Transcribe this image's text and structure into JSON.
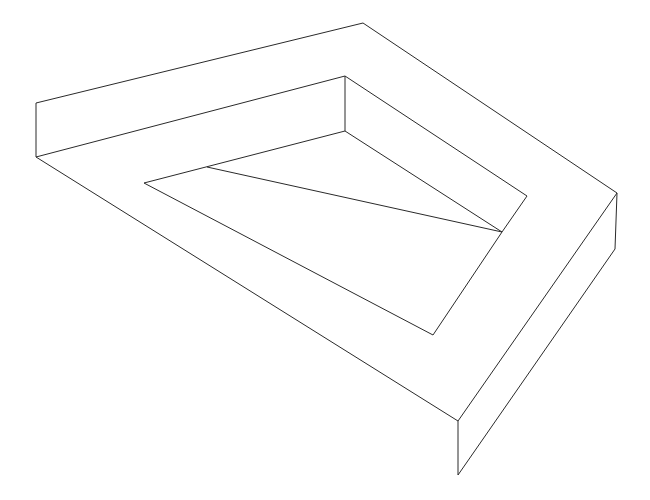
{
  "diagram": {
    "title": "",
    "stroke_color": "#2a2a2a",
    "background": "#ffffff",
    "edges": [
      {
        "name": "outer-top-left-edge",
        "x1": 36,
        "y1": 103,
        "x2": 363,
        "y2": 23
      },
      {
        "name": "outer-top-right-edge",
        "x1": 363,
        "y1": 23,
        "x2": 617,
        "y2": 193
      },
      {
        "name": "left-vertical-edge",
        "x1": 36,
        "y1": 103,
        "x2": 36,
        "y2": 157
      },
      {
        "name": "left-bottom-edge",
        "x1": 36,
        "y1": 157,
        "x2": 345,
        "y2": 76
      },
      {
        "name": "left-long-diagonal",
        "x1": 36,
        "y1": 157,
        "x2": 458,
        "y2": 421
      },
      {
        "name": "inner-vertical-edge",
        "x1": 345,
        "y1": 76,
        "x2": 345,
        "y2": 131
      },
      {
        "name": "inner-top-right-edge",
        "x1": 345,
        "y1": 76,
        "x2": 527,
        "y2": 196
      },
      {
        "name": "inner-lower-edge",
        "x1": 345,
        "y1": 131,
        "x2": 144,
        "y2": 183
      },
      {
        "name": "inner-right-lower-edge",
        "x1": 345,
        "y1": 131,
        "x2": 502,
        "y2": 232
      },
      {
        "name": "inner-right-short-edge",
        "x1": 527,
        "y1": 196,
        "x2": 502,
        "y2": 232
      },
      {
        "name": "inner-left-diagonal",
        "x1": 144,
        "y1": 183,
        "x2": 433,
        "y2": 335
      },
      {
        "name": "inner-divider",
        "x1": 207,
        "y1": 167,
        "x2": 502,
        "y2": 232
      },
      {
        "name": "inner-bottom-right-edge",
        "x1": 433,
        "y1": 335,
        "x2": 502,
        "y2": 232
      },
      {
        "name": "outer-right-diagonal",
        "x1": 617,
        "y1": 193,
        "x2": 458,
        "y2": 421
      },
      {
        "name": "right-vertical-edge",
        "x1": 617,
        "y1": 193,
        "x2": 615,
        "y2": 249
      },
      {
        "name": "front-vertical-edge",
        "x1": 458,
        "y1": 421,
        "x2": 458,
        "y2": 475
      },
      {
        "name": "bottom-right-edge",
        "x1": 615,
        "y1": 249,
        "x2": 458,
        "y2": 475
      },
      {
        "name": "bottom-left-edge",
        "x1": 36,
        "y1": 157,
        "x2": 36,
        "y2": 157
      }
    ]
  }
}
